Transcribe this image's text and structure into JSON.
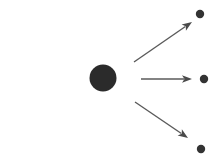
{
  "figure": {
    "title": "",
    "width": 224,
    "height": 161,
    "background_color": "#ffffff"
  },
  "colors": {
    "arrow_stroke": "#5a5a5a",
    "arrow_head_fill": "#4a4a4a",
    "nucleus_fill": "#2b2b2b",
    "particle_fill": "#333333",
    "background": "#ffffff"
  },
  "nucleus": {
    "label": "target-nucleus",
    "cx": 103,
    "cy": 78,
    "r": 13.5,
    "fill": "#2b2b2b"
  },
  "incoming": {
    "label": "incoming-beam-arrow",
    "x1": 15,
    "y1": 79,
    "x2": 77,
    "y2": 79,
    "stroke_width": 1.6,
    "head_length": 9,
    "head_half_width": 3.6
  },
  "outgoing": [
    {
      "label": "upper-right-arrow",
      "x1": 134,
      "y1": 62,
      "x2": 192,
      "y2": 22,
      "stroke_width": 1.4,
      "head_length": 10,
      "head_half_width": 3.8
    },
    {
      "label": "middle-right-arrow",
      "x1": 141,
      "y1": 79,
      "x2": 192,
      "y2": 79,
      "stroke_width": 1.4,
      "head_length": 10,
      "head_half_width": 3.8
    },
    {
      "label": "lower-right-arrow",
      "x1": 135,
      "y1": 102,
      "x2": 188,
      "y2": 138,
      "stroke_width": 1.4,
      "head_length": 10,
      "head_half_width": 3.8
    }
  ],
  "particles": [
    {
      "label": "scattered-particle-top",
      "cx": 200,
      "cy": 14,
      "r": 4.2,
      "fill": "#333333"
    },
    {
      "label": "scattered-particle-middle",
      "cx": 204,
      "cy": 79,
      "r": 4.2,
      "fill": "#333333"
    },
    {
      "label": "scattered-particle-bottom",
      "cx": 201,
      "cy": 149,
      "r": 4.2,
      "fill": "#333333"
    }
  ]
}
